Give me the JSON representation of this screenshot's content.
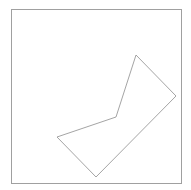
{
  "canvas": {
    "width": 191,
    "height": 190,
    "background": "#ffffff"
  },
  "frame": {
    "x": 11.5,
    "y": 9.5,
    "width": 170,
    "height": 174,
    "stroke": "#a0a0a0",
    "stroke_width": 1
  },
  "polygon": {
    "points": "136,55 176,96 96,177 57,137 116,117",
    "stroke": "#9a9a9a",
    "stroke_width": 0.9,
    "fill": "none"
  }
}
